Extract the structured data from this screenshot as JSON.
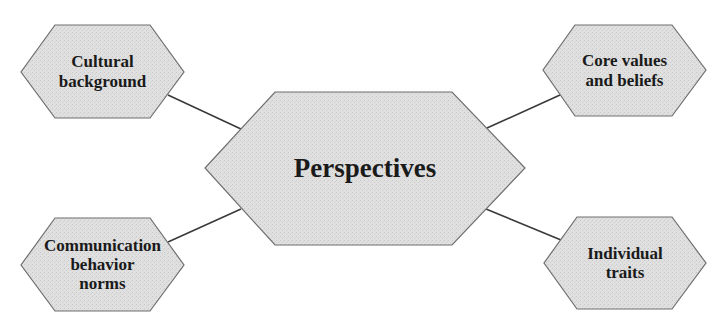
{
  "diagram": {
    "center": {
      "label": "Perspectives"
    },
    "nodes": [
      {
        "id": "top-left",
        "lines": [
          "Cultural",
          "background"
        ]
      },
      {
        "id": "top-right",
        "lines": [
          "Core values",
          "and beliefs"
        ]
      },
      {
        "id": "bottom-left",
        "lines": [
          "Communication",
          "behavior",
          "norms"
        ]
      },
      {
        "id": "bottom-right",
        "lines": [
          "Individual",
          "traits"
        ]
      }
    ],
    "colors": {
      "fill": "#dcdcdc",
      "stroke": "#6e6e6e",
      "connector": "#3a3a3a",
      "text": "#1a1a1a"
    }
  }
}
